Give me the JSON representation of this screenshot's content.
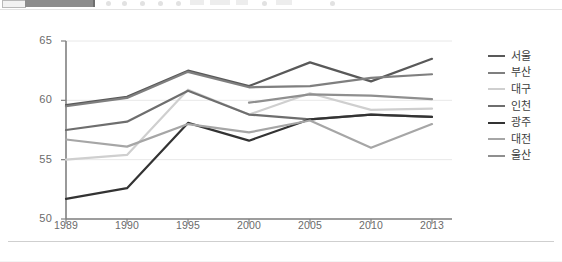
{
  "toolbar": {
    "present": true,
    "note": "cut-off application toolbar strip"
  },
  "chart_data": {
    "type": "line",
    "title": "",
    "subtitle": "",
    "xlabel": "",
    "ylabel": "",
    "categories": [
      "1989",
      "1990",
      "1995",
      "2000",
      "2005",
      "2010",
      "2013"
    ],
    "ylim": [
      50,
      65
    ],
    "yticks": [
      50,
      55,
      60,
      65
    ],
    "grid": true,
    "legend_position": "right",
    "series": [
      {
        "name": "서울",
        "color": "#595959",
        "values": [
          59.6,
          60.3,
          62.5,
          61.2,
          63.2,
          61.6,
          63.5
        ]
      },
      {
        "name": "부산",
        "color": "#7f7f7f",
        "values": [
          59.5,
          60.2,
          62.4,
          61.1,
          61.2,
          61.9,
          62.2
        ]
      },
      {
        "name": "대구",
        "color": "#cfcfcf",
        "values": [
          55.0,
          55.4,
          60.9,
          58.8,
          60.6,
          59.2,
          59.3
        ]
      },
      {
        "name": "인천",
        "color": "#6e6e6e",
        "values": [
          57.5,
          58.2,
          60.8,
          58.8,
          58.4,
          58.8,
          58.6
        ]
      },
      {
        "name": "광주",
        "color": "#333333",
        "values": [
          51.7,
          52.6,
          58.1,
          56.6,
          58.4,
          58.8,
          58.6
        ]
      },
      {
        "name": "대전",
        "color": "#a6a6a6",
        "values": [
          56.7,
          56.1,
          58.0,
          57.3,
          58.3,
          56.0,
          58.0
        ]
      },
      {
        "name": "울산",
        "color": "#8f8f8f",
        "values": [
          null,
          null,
          null,
          59.8,
          60.5,
          60.4,
          60.1
        ]
      }
    ]
  },
  "legend": {
    "items": [
      {
        "label": "서울",
        "color": "#595959"
      },
      {
        "label": "부산",
        "color": "#7f7f7f"
      },
      {
        "label": "대구",
        "color": "#cfcfcf"
      },
      {
        "label": "인천",
        "color": "#6e6e6e"
      },
      {
        "label": "광주",
        "color": "#333333"
      },
      {
        "label": "대전",
        "color": "#a6a6a6"
      },
      {
        "label": "울산",
        "color": "#8f8f8f"
      }
    ]
  },
  "axes": {
    "y_labels": [
      "65",
      "60",
      "55",
      "50"
    ],
    "x_labels": [
      "1989",
      "1990",
      "1995",
      "2000",
      "2005",
      "2010",
      "2013"
    ]
  },
  "colors": {
    "axis_line": "#808080",
    "grid_line": "#e8e8e8",
    "tick_text": "#6b6b6b",
    "legend_text": "#3d3d3d",
    "rule": "#cfcfcf"
  }
}
